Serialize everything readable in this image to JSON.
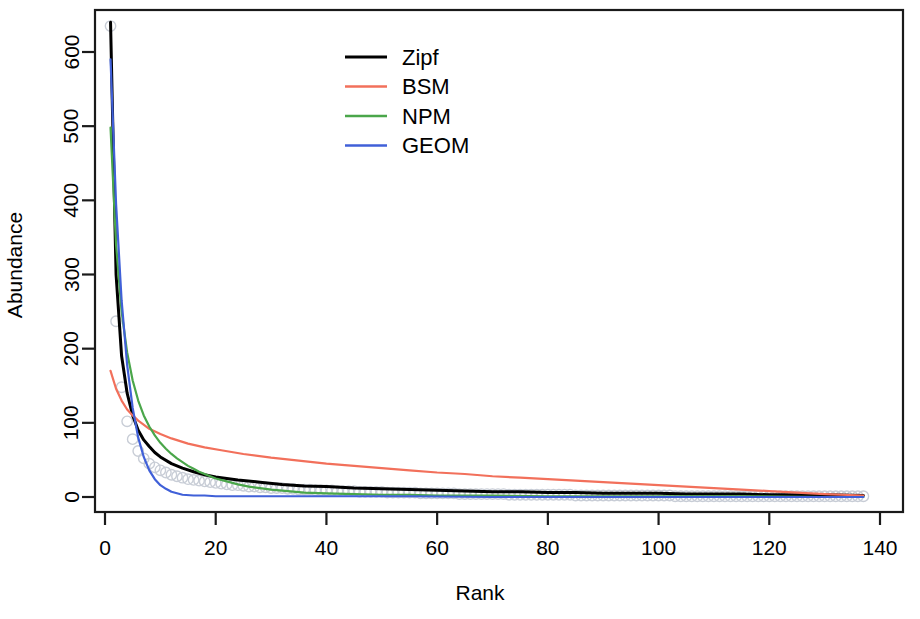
{
  "chart_data": {
    "type": "line",
    "title": "",
    "xlabel": "Rank",
    "ylabel": "Abundance",
    "xlim": [
      0,
      140
    ],
    "ylim": [
      0,
      660
    ],
    "grid": false,
    "legend_position": "top-center",
    "xticks": [
      0,
      20,
      40,
      60,
      80,
      100,
      120,
      140
    ],
    "yticks": [
      0,
      100,
      200,
      300,
      400,
      500,
      600
    ],
    "xtick_labels": [
      "0",
      "20",
      "40",
      "60",
      "80",
      "100",
      "120",
      "140"
    ],
    "ytick_labels": [
      "0",
      "100",
      "200",
      "300",
      "400",
      "500",
      "600"
    ],
    "n_ranks": 137,
    "observed": {
      "name": "Observed abundance",
      "marker": "open-circle",
      "color": "#c8cdd6",
      "x": [
        1,
        2,
        3,
        4,
        5,
        6,
        7,
        8,
        9,
        10,
        11,
        12,
        13,
        14,
        15,
        16,
        17,
        18,
        19,
        20,
        21,
        22,
        23,
        24,
        25,
        26,
        27,
        28,
        29,
        30,
        31,
        32,
        33,
        34,
        35,
        36,
        37,
        38,
        39,
        40,
        41,
        42,
        43,
        44,
        45,
        46,
        47,
        48,
        49,
        50,
        51,
        52,
        53,
        54,
        55,
        56,
        57,
        58,
        59,
        60,
        61,
        62,
        63,
        64,
        65,
        66,
        67,
        68,
        69,
        70,
        71,
        72,
        73,
        74,
        75,
        76,
        77,
        78,
        79,
        80,
        81,
        82,
        83,
        84,
        85,
        86,
        87,
        88,
        89,
        90,
        91,
        92,
        93,
        94,
        95,
        96,
        97,
        98,
        99,
        100,
        101,
        102,
        103,
        104,
        105,
        106,
        107,
        108,
        109,
        110,
        111,
        112,
        113,
        114,
        115,
        116,
        117,
        118,
        119,
        120,
        121,
        122,
        123,
        124,
        125,
        126,
        127,
        128,
        129,
        130,
        131,
        132,
        133,
        134,
        135,
        136,
        137
      ],
      "y": [
        635,
        237,
        148,
        102,
        78,
        62,
        52,
        45,
        40,
        36,
        33,
        30,
        28,
        26,
        24,
        23,
        22,
        21,
        20,
        19,
        18,
        17,
        16,
        16,
        15,
        14,
        14,
        13,
        13,
        12,
        12,
        12,
        11,
        11,
        10,
        10,
        10,
        9,
        9,
        9,
        9,
        8,
        8,
        8,
        8,
        7,
        7,
        7,
        7,
        7,
        6,
        6,
        6,
        6,
        6,
        6,
        5,
        5,
        5,
        5,
        5,
        5,
        5,
        4,
        4,
        4,
        4,
        4,
        4,
        4,
        4,
        4,
        3,
        3,
        3,
        3,
        3,
        3,
        3,
        3,
        3,
        3,
        3,
        3,
        2,
        2,
        2,
        2,
        2,
        2,
        2,
        2,
        2,
        2,
        2,
        2,
        2,
        2,
        2,
        2,
        2,
        2,
        1,
        1,
        1,
        1,
        1,
        1,
        1,
        1,
        1,
        1,
        1,
        1,
        1,
        1,
        1,
        1,
        1,
        1,
        1,
        1,
        1,
        1,
        1,
        1,
        1,
        1,
        1,
        1,
        1,
        1,
        1,
        1,
        1,
        1,
        1
      ]
    },
    "series": [
      {
        "name": "Zipf",
        "color": "#000000",
        "x": [
          1,
          2,
          3,
          4,
          5,
          6,
          7,
          8,
          9,
          10,
          12,
          14,
          16,
          18,
          20,
          24,
          28,
          32,
          36,
          40,
          45,
          50,
          55,
          60,
          65,
          70,
          75,
          80,
          85,
          90,
          95,
          100,
          105,
          110,
          115,
          120,
          125,
          130,
          137
        ],
        "y": [
          640,
          300,
          190,
          140,
          110,
          90,
          77,
          68,
          60,
          54,
          45,
          39,
          34,
          30,
          27,
          23,
          20,
          17,
          15,
          14,
          12,
          11,
          10,
          9,
          8,
          7,
          7,
          6,
          6,
          5,
          5,
          5,
          4,
          4,
          4,
          3,
          3,
          3,
          2
        ]
      },
      {
        "name": "BSM",
        "color": "#f2705b",
        "x": [
          1,
          2,
          3,
          4,
          5,
          6,
          8,
          10,
          12,
          15,
          18,
          21,
          25,
          30,
          35,
          40,
          45,
          50,
          55,
          60,
          65,
          70,
          75,
          80,
          85,
          90,
          95,
          100,
          105,
          110,
          115,
          120,
          125,
          130,
          137
        ],
        "y": [
          170,
          146,
          130,
          118,
          110,
          103,
          92,
          85,
          79,
          72,
          67,
          63,
          58,
          53,
          49,
          45,
          42,
          39,
          36,
          33,
          31,
          28,
          26,
          24,
          22,
          20,
          18,
          16,
          14,
          12,
          10,
          8,
          6,
          4,
          2
        ]
      },
      {
        "name": "NPM",
        "color": "#4aa64a",
        "x": [
          1,
          2,
          3,
          4,
          5,
          6,
          7,
          8,
          9,
          10,
          11,
          12,
          13,
          14,
          15,
          16,
          17,
          18,
          19,
          20,
          22,
          24,
          26,
          28,
          30,
          33,
          36,
          40,
          45,
          50,
          55,
          60,
          70,
          80,
          90,
          100,
          115,
          130,
          137
        ],
        "y": [
          498,
          340,
          250,
          195,
          157,
          130,
          110,
          95,
          83,
          73,
          65,
          58,
          52,
          47,
          42,
          38,
          34,
          31,
          28,
          25,
          21,
          17,
          14,
          12,
          10,
          8,
          6,
          5,
          4,
          3,
          3,
          2,
          2,
          1,
          1,
          1,
          1,
          0,
          0
        ]
      },
      {
        "name": "GEOM",
        "color": "#4060d8",
        "x": [
          1,
          2,
          3,
          4,
          5,
          6,
          7,
          8,
          9,
          10,
          11,
          12,
          13,
          14,
          16,
          18,
          20,
          25,
          30,
          40,
          55,
          70,
          90,
          110,
          137
        ],
        "y": [
          590,
          395,
          265,
          178,
          120,
          80,
          54,
          36,
          24,
          16,
          11,
          7,
          5,
          3,
          2,
          2,
          1,
          1,
          1,
          1,
          1,
          0,
          0,
          0,
          0
        ]
      }
    ],
    "legend": [
      {
        "label": "Zipf",
        "color": "#000000"
      },
      {
        "label": "BSM",
        "color": "#f2705b"
      },
      {
        "label": "NPM",
        "color": "#4aa64a"
      },
      {
        "label": "GEOM",
        "color": "#4060d8"
      }
    ]
  }
}
